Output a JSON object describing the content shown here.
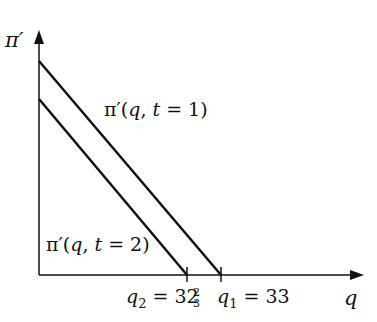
{
  "diagram": {
    "y_axis_label": "π′",
    "x_axis_label": "q",
    "curves": [
      {
        "name": "pi-prime-t1",
        "label_prefix": "π′(",
        "label_var1": "q",
        "label_sep": ", ",
        "label_var2": "t",
        "label_suffix": " = 1)",
        "x_intercept_label": "q",
        "x_intercept_sub": "1",
        "x_intercept_value": " = 33"
      },
      {
        "name": "pi-prime-t2",
        "label_prefix": "π′(",
        "label_var1": "q",
        "label_sep": ", ",
        "label_var2": "t",
        "label_suffix": " = 2)",
        "x_intercept_label": "q",
        "x_intercept_sub": "2",
        "x_intercept_value_whole": " = 32",
        "x_intercept_frac_num": "2",
        "x_intercept_frac_den": "3"
      }
    ],
    "colors": {
      "stroke": "#111111",
      "background": "#ffffff"
    }
  }
}
